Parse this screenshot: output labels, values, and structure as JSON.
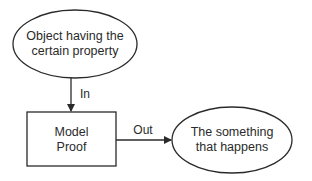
{
  "diagram": {
    "nodes": [
      {
        "id": "object",
        "shape": "ellipse",
        "lines": [
          "Object having the",
          "certain property"
        ]
      },
      {
        "id": "model",
        "shape": "rectangle",
        "lines": [
          "Model",
          "Proof"
        ]
      },
      {
        "id": "outcome",
        "shape": "ellipse",
        "lines": [
          "The something",
          "that happens"
        ]
      }
    ],
    "edges": [
      {
        "from": "object",
        "to": "model",
        "label": "In"
      },
      {
        "from": "model",
        "to": "outcome",
        "label": "Out"
      }
    ],
    "colors": {
      "stroke": "#2a2a2a",
      "fill": "#ffffff",
      "background": "#ffffff"
    }
  }
}
